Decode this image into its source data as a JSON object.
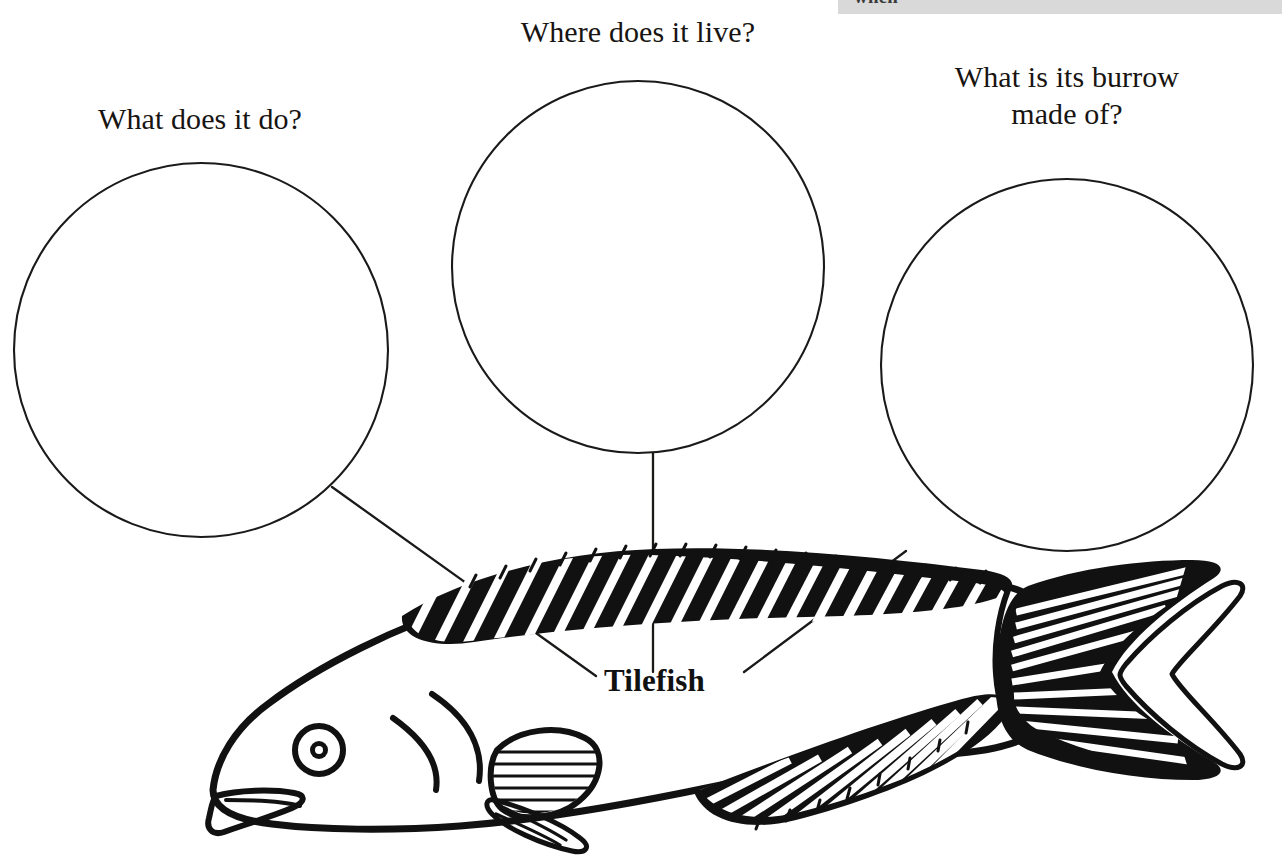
{
  "page": {
    "background_color": "#ffffff",
    "ink_color": "#111111",
    "width": 1282,
    "height": 863
  },
  "header_strip": {
    "visible": true,
    "background_color": "#d9d9d9",
    "clipped_text": "when"
  },
  "questions": [
    {
      "id": "q1",
      "label": "What does it do?"
    },
    {
      "id": "q2",
      "label": "Where does it live?"
    },
    {
      "id": "q3",
      "label": "What is its burrow\nmade of?"
    }
  ],
  "bubbles": [
    {
      "id": "bubble-1",
      "cx": 201,
      "cy": 350,
      "r": 187
    },
    {
      "id": "bubble-2",
      "cx": 638,
      "cy": 267,
      "r": 186
    },
    {
      "id": "bubble-3",
      "cx": 1067,
      "cy": 365,
      "r": 186
    }
  ],
  "leaders": [
    {
      "id": "leader-1",
      "from": "bubble-1",
      "x1": 332,
      "y1": 487,
      "x2": 596,
      "y2": 676
    },
    {
      "id": "leader-2",
      "from": "bubble-2",
      "x1": 653,
      "y1": 453,
      "x2": 653,
      "y2": 672
    },
    {
      "id": "leader-3",
      "from": "bubble-3",
      "x1": 906,
      "y1": 551,
      "x2": 744,
      "y2": 672
    }
  ],
  "species_label": {
    "text": "Tilefish",
    "weight": "bold"
  },
  "illustration": {
    "name": "tilefish-line-drawing",
    "subject": "Tilefish",
    "style": "black ink line art, hatched fins",
    "parts": [
      "body-outline",
      "head",
      "eye",
      "mouth",
      "gill-arcs",
      "dorsal-fin",
      "pectoral-fin",
      "pelvic-fin",
      "anal-fin",
      "caudal-fin"
    ]
  }
}
